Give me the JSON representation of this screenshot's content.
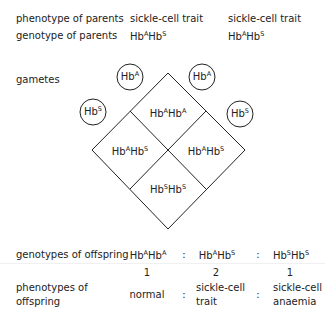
{
  "parents": {
    "phenotype_label": "phenotype of parents",
    "genotype_label": "genotype of parents",
    "parent1": {
      "phenotype": "sickle-cell trait",
      "genotype": {
        "a": "Hb",
        "a_sup": "A",
        "b": "Hb",
        "b_sup": "S"
      }
    },
    "parent2": {
      "phenotype": "sickle-cell trait",
      "genotype": {
        "a": "Hb",
        "a_sup": "A",
        "b": "Hb",
        "b_sup": "S"
      }
    }
  },
  "gametes": {
    "label": "gametes",
    "top_left": {
      "base": "Hb",
      "sup": "A"
    },
    "top_right": {
      "base": "Hb",
      "sup": "A"
    },
    "left": {
      "base": "Hb",
      "sup": "S"
    },
    "right": {
      "base": "Hb",
      "sup": "S"
    }
  },
  "punnett": {
    "top": {
      "a": "Hb",
      "a_sup": "A",
      "b": "Hb",
      "b_sup": "A"
    },
    "left": {
      "a": "Hb",
      "a_sup": "A",
      "b": "Hb",
      "b_sup": "S"
    },
    "right": {
      "a": "Hb",
      "a_sup": "A",
      "b": "Hb",
      "b_sup": "S"
    },
    "bottom": {
      "a": "Hb",
      "a_sup": "S",
      "b": "Hb",
      "b_sup": "S"
    }
  },
  "offspring": {
    "genotypes_label": "genotypes of offspring",
    "phenotypes_label_line1": "phenotypes of",
    "phenotypes_label_line2": "offspring",
    "separator": ":",
    "columns": [
      {
        "genotype": {
          "a": "Hb",
          "a_sup": "A",
          "b": "Hb",
          "b_sup": "A"
        },
        "ratio": "1",
        "phenotype_line1": "normal",
        "phenotype_line2": ""
      },
      {
        "genotype": {
          "a": "Hb",
          "a_sup": "A",
          "b": "Hb",
          "b_sup": "S"
        },
        "ratio": "2",
        "phenotype_line1": "sickle-cell",
        "phenotype_line2": "trait"
      },
      {
        "genotype": {
          "a": "Hb",
          "a_sup": "S",
          "b": "Hb",
          "b_sup": "S"
        },
        "ratio": "1",
        "phenotype_line1": "sickle-cell",
        "phenotype_line2": "anaemia"
      }
    ]
  },
  "colors": {
    "text": "#222222",
    "lines": "#222222",
    "background": "#ffffff"
  }
}
